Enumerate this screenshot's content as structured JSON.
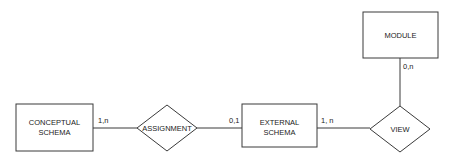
{
  "diagram": {
    "type": "entity-relationship",
    "entities": [
      {
        "id": "conceptual_schema",
        "line1": "CONCEPTUAL",
        "line2": "SCHEMA"
      },
      {
        "id": "external_schema",
        "line1": "EXTERNAL",
        "line2": "SCHEMA"
      },
      {
        "id": "module",
        "label": "MODULE"
      }
    ],
    "relationships": [
      {
        "id": "assignment",
        "label": "ASSIGNMENT"
      },
      {
        "id": "view",
        "label": "VIEW"
      }
    ],
    "edges": [
      {
        "from": "conceptual_schema",
        "to": "assignment",
        "cardinality": "1,n"
      },
      {
        "from": "assignment",
        "to": "external_schema",
        "cardinality": "0,1"
      },
      {
        "from": "external_schema",
        "to": "view",
        "cardinality": "1, n"
      },
      {
        "from": "module",
        "to": "view",
        "cardinality": "0,n"
      }
    ],
    "colors": {
      "stroke": "#3a3a3a",
      "text": "#222222",
      "background": "#ffffff"
    }
  }
}
